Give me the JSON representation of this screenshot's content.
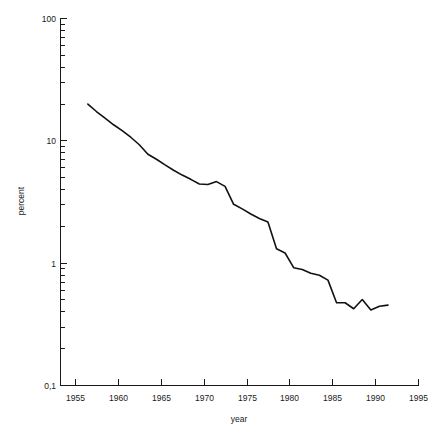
{
  "chart_data": {
    "type": "line",
    "title": "",
    "xlabel": "year",
    "ylabel": "percent",
    "x_tick_labels": [
      "1955",
      "1960",
      "1965",
      "1970",
      "1975",
      "1980",
      "1985",
      "1990",
      "1995"
    ],
    "x_ticks": [
      1955,
      1960,
      1965,
      1970,
      1975,
      1980,
      1985,
      1990,
      1995
    ],
    "xlim": [
      1955,
      1995
    ],
    "y_tick_labels": [
      "100",
      "10",
      "1",
      "0,1"
    ],
    "y_ticks": [
      100,
      10,
      1,
      0.1
    ],
    "ylim": [
      0.1,
      100
    ],
    "yscale": "log",
    "grid": false,
    "legend": null,
    "series": [
      {
        "name": "percent",
        "x": [
          1956.5,
          1957.5,
          1958.5,
          1959.5,
          1960.5,
          1961.5,
          1962.5,
          1963.5,
          1964.5,
          1965.5,
          1966.5,
          1967.5,
          1968.5,
          1969.5,
          1970.5,
          1971.5,
          1972.5,
          1973.5,
          1974.5,
          1975.5,
          1976.5,
          1977.5,
          1978.5,
          1979.5,
          1980.5,
          1981.5,
          1982.5,
          1983.5,
          1984.5,
          1985.5,
          1986.5,
          1987.5,
          1988.5,
          1989.5,
          1990.5,
          1991.5
        ],
        "values": [
          19.8,
          17.2,
          15.2,
          13.4,
          12.0,
          10.6,
          9.2,
          7.7,
          7.0,
          6.3,
          5.7,
          5.2,
          4.8,
          4.4,
          4.35,
          4.6,
          4.2,
          3.0,
          2.75,
          2.5,
          2.3,
          2.15,
          1.3,
          1.2,
          0.91,
          0.88,
          0.82,
          0.79,
          0.72,
          0.47,
          0.47,
          0.42,
          0.5,
          0.41,
          0.44,
          0.45
        ]
      }
    ]
  },
  "layout": {
    "plot": {
      "x0": 75,
      "x1": 418,
      "y_top": 18,
      "y_bottom": 385,
      "axis_corner_x": 60
    }
  }
}
